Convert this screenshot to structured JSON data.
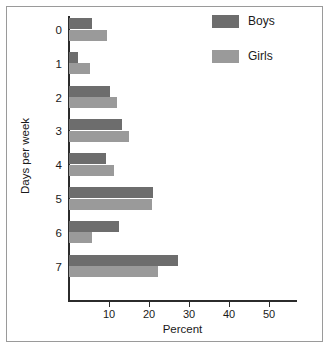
{
  "chart_data": {
    "type": "bar",
    "orientation": "horizontal",
    "title": "",
    "xlabel": "Percent",
    "ylabel": "Days per week",
    "categories": [
      "0",
      "1",
      "2",
      "3",
      "4",
      "5",
      "6",
      "7"
    ],
    "series": [
      {
        "name": "Boys",
        "color": "#6d6d6d",
        "values": [
          5.7,
          2.2,
          10.2,
          13.2,
          9.2,
          21.1,
          12.6,
          27.3
        ]
      },
      {
        "name": "Girls",
        "color": "#9a9a9a",
        "values": [
          9.4,
          5.3,
          11.9,
          15.0,
          11.3,
          20.8,
          5.7,
          22.2
        ]
      }
    ],
    "xlim": [
      0,
      57
    ],
    "xticks": [
      10,
      20,
      30,
      40,
      50
    ],
    "xtick_labels": [
      "10",
      "20",
      "30",
      "40",
      "50"
    ],
    "grid": false,
    "legend_position": "top-right",
    "legend_entries": [
      "Boys",
      "Girls"
    ]
  },
  "axes": {
    "x_title": "Percent",
    "y_title": "Days per week"
  }
}
